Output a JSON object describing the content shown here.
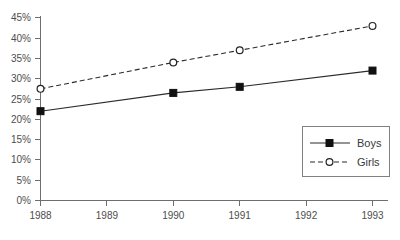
{
  "chart_data": {
    "type": "line",
    "title": "",
    "xlabel": "",
    "ylabel": "",
    "x": [
      1988,
      1989,
      1990,
      1991,
      1992,
      1993
    ],
    "categories": [
      "1988",
      "1989",
      "1990",
      "1991",
      "1992",
      "1993"
    ],
    "xlim": [
      1988,
      1993
    ],
    "ylim": [
      0,
      45
    ],
    "grid": false,
    "legend_position": "bottom-right",
    "y_tick_labels": [
      "0%",
      "5%",
      "10%",
      "15%",
      "20%",
      "25%",
      "30%",
      "35%",
      "40%",
      "45%"
    ],
    "y_tick_values": [
      0,
      5,
      10,
      15,
      20,
      25,
      30,
      35,
      40,
      45
    ],
    "x_tick_labels": [
      "1988",
      "1989",
      "1990",
      "1991",
      "1992",
      "1993"
    ],
    "series": [
      {
        "name": "Boys",
        "marker": "filled-square",
        "line_style": "solid",
        "color": "#2a2a2a",
        "x": [
          1988,
          1990,
          1991,
          1993
        ],
        "values": [
          22,
          26.5,
          28,
          32
        ],
        "marker_points": [
          {
            "x": 1988,
            "y": 22
          },
          {
            "x": 1990,
            "y": 26.5
          },
          {
            "x": 1991,
            "y": 28
          },
          {
            "x": 1993,
            "y": 32
          }
        ]
      },
      {
        "name": "Girls",
        "marker": "open-circle",
        "line_style": "dashed",
        "color": "#2a2a2a",
        "x": [
          1988,
          1990,
          1991,
          1993
        ],
        "values": [
          27.5,
          34,
          37,
          43
        ],
        "marker_points": [
          {
            "x": 1988,
            "y": 27.5
          },
          {
            "x": 1990,
            "y": 34
          },
          {
            "x": 1991,
            "y": 37
          },
          {
            "x": 1993,
            "y": 43
          }
        ]
      }
    ],
    "legend": [
      {
        "label": "Boys",
        "marker": "filled-square",
        "line_style": "solid"
      },
      {
        "label": "Girls",
        "marker": "open-circle",
        "line_style": "dashed"
      }
    ]
  },
  "axis": {
    "y_labels": {
      "t0": "0%",
      "t1": "5%",
      "t2": "10%",
      "t3": "15%",
      "t4": "20%",
      "t5": "25%",
      "t6": "30%",
      "t7": "35%",
      "t8": "40%",
      "t9": "45%"
    },
    "x_labels": {
      "t0": "1988",
      "t1": "1989",
      "t2": "1990",
      "t3": "1991",
      "t4": "1992",
      "t5": "1993"
    }
  },
  "legend": {
    "boys_label": "Boys",
    "girls_label": "Girls"
  },
  "colors": {
    "axis": "#6e6e6e",
    "series": "#2a2a2a",
    "text": "#4d4d4d",
    "legend_border": "#808080",
    "background": "#ffffff"
  }
}
